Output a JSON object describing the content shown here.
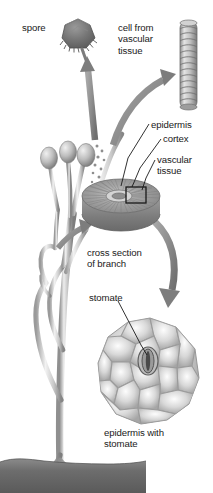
{
  "figure": {
    "background_color": "#ffffff",
    "width": 213,
    "height": 493
  },
  "palette": {
    "ink": "#1a1a1a",
    "arrow_gray": "#8d8d8d",
    "arrow_gray_dark": "#6f6f6f",
    "spore_dark": "#6b6b6b",
    "plant_light": "#d9d9d9",
    "plant_mid": "#b0b0b0",
    "plant_dark": "#7d7d7d",
    "disc_top": "#9a9a9a",
    "disc_side": "#848484",
    "soil_dark": "#6a6a6a",
    "cell_light": "#e6e6e6",
    "cell_edge": "#9e9e9e"
  },
  "labels": [
    {
      "id": "spore",
      "text": "spore",
      "x": 22,
      "y": 22,
      "align": "left"
    },
    {
      "id": "cell-from-vascular-tissue",
      "text": "cell from\nvascular\ntissue",
      "x": 118,
      "y": 22,
      "align": "left"
    },
    {
      "id": "epidermis",
      "text": "epidermis",
      "x": 151,
      "y": 119,
      "align": "left"
    },
    {
      "id": "cortex",
      "text": "cortex",
      "x": 163,
      "y": 133,
      "align": "left"
    },
    {
      "id": "vascular-tissue",
      "text": "vascular\ntissue",
      "x": 157,
      "y": 154,
      "align": "left"
    },
    {
      "id": "cross-section-of-branch",
      "text": "cross section\nof branch",
      "x": 87,
      "y": 247,
      "align": "left"
    },
    {
      "id": "stomate",
      "text": "stomate",
      "x": 89,
      "y": 292,
      "align": "left"
    },
    {
      "id": "epidermis-with-stomate",
      "text": "epidermis with\nstomate",
      "x": 104,
      "y": 427,
      "align": "left"
    }
  ],
  "structures": [
    {
      "id": "spore-body",
      "name": "spore",
      "description": "dark fringed polygonal spore, top left-center"
    },
    {
      "id": "vascular-cell",
      "name": "cell-from-vascular-tissue",
      "description": "ringed cylindrical conducting cell, top right"
    },
    {
      "id": "plant",
      "name": "whisk-fern-plant",
      "description": "branching dichotomous green stems with three sporangia and underground rhizome"
    },
    {
      "id": "cross-section-disc",
      "name": "cross-section-of-branch",
      "description": "cylindrical disc with radial cortex striations and central vascular ring"
    },
    {
      "id": "epidermis-disc",
      "name": "epidermis-with-stomate",
      "description": "polygonal epidermal cells with one central stomate"
    },
    {
      "id": "soil",
      "name": "soil-line",
      "description": "dark soil band with horizontal rhizome and rhizoids"
    }
  ],
  "leaders": [
    {
      "id": "leader-epidermis",
      "from_label": "epidermis",
      "to_structure": "cross-section-disc-rim"
    },
    {
      "id": "leader-cortex",
      "from_label": "cortex",
      "to_structure": "cross-section-disc-cortex"
    },
    {
      "id": "leader-vascular-tissue",
      "from_label": "vascular-tissue",
      "to_structure": "cross-section-disc-center-box"
    },
    {
      "id": "leader-stomate",
      "from_label": "stomate",
      "to_structure": "epidermis-disc-stomate"
    }
  ],
  "arrows": [
    {
      "id": "arrow-sporangium-to-spore",
      "from": "sporangium",
      "to": "spore-body"
    },
    {
      "id": "arrow-branch-to-vascular-cell",
      "from": "branch",
      "to": "vascular-cell"
    },
    {
      "id": "arrow-branch-to-cross-section",
      "from": "branch",
      "to": "cross-section-disc"
    },
    {
      "id": "arrow-cross-section-to-epidermis",
      "from": "cross-section-disc",
      "to": "epidermis-disc"
    }
  ]
}
